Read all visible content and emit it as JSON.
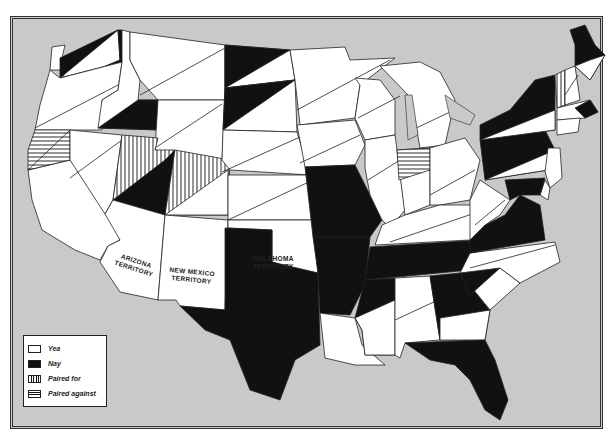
{
  "map": {
    "title": "",
    "background_color": "#c9c9c9",
    "colors": {
      "yea": "#ffffff",
      "nay": "#111111",
      "border": "#222222"
    },
    "territory_labels": [
      {
        "name": "arizona",
        "line1": "ARIZONA",
        "line2": "TERRITORY"
      },
      {
        "name": "new-mexico",
        "line1": "NEW MEXICO",
        "line2": "TERRITORY"
      },
      {
        "name": "oklahoma",
        "line1": "OKLAHOMA",
        "line2": "TERRITORY"
      }
    ]
  },
  "legend": {
    "items": [
      {
        "key": "yea",
        "label": "Yea"
      },
      {
        "key": "nay",
        "label": "Nay"
      },
      {
        "key": "paired_for",
        "label": "Paired for"
      },
      {
        "key": "paired_against",
        "label": "Paired against"
      }
    ]
  },
  "states": {
    "WA": "yea/nay split",
    "OR": "yea/yea split",
    "CA": "paired against/yea split",
    "ID": "yea/nay split",
    "NV": "yea/yea split",
    "UT": "paired for/nay split",
    "MT": "yea/yea split",
    "WY": "yea/yea split",
    "CO": "paired for/yea split",
    "ND": "nay/yea split",
    "SD": "nay/yea split",
    "NE": "yea/yea split",
    "KS": "yea/yea split",
    "MN": "yea/yea split",
    "IA": "yea/yea split",
    "MO": "nay",
    "WI": "yea/yea split",
    "IL": "yea/yea split",
    "MI": "yea/yea split",
    "IN": "paired against/yea split",
    "OH": "yea/yea split",
    "KY": "yea/yea split",
    "TN": "nay",
    "AR": "nay",
    "LA": "yea",
    "MS": "nay/yea split",
    "AL": "yea/yea split",
    "GA": "nay/yea split",
    "FL": "nay",
    "SC": "nay/yea split",
    "NC": "yea/yea split",
    "VA": "nay",
    "WV": "yea/yea split",
    "TX": "nay",
    "PA": "nay/yea split",
    "NY": "nay/yea split",
    "VT": "paired for/yea split",
    "NH": "yea/yea split",
    "ME": "nay/yea split",
    "MA": "yea/nay split",
    "NJ": "yea",
    "MD": "nay/yea split",
    "DE": "yea",
    "AZ": "yea",
    "NM": "yea",
    "OK": "yea"
  }
}
